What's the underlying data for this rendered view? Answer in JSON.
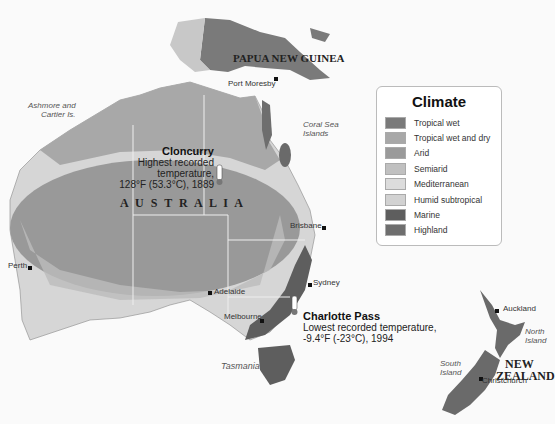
{
  "legend": {
    "title": "Climate",
    "items": [
      {
        "label": "Tropical wet",
        "color": "#7a7a7a"
      },
      {
        "label": "Tropical wet and dry",
        "color": "#a8a8a8"
      },
      {
        "label": "Arid",
        "color": "#9a9a9a"
      },
      {
        "label": "Semiarid",
        "color": "#c0c0c0"
      },
      {
        "label": "Mediterranean",
        "color": "#dcdcdc"
      },
      {
        "label": "Humid subtropical",
        "color": "#d2d2d2"
      },
      {
        "label": "Marine",
        "color": "#5e5e5e"
      },
      {
        "label": "Highland",
        "color": "#6e6e6e"
      }
    ]
  },
  "countries": {
    "png": "PAPUA NEW GUINEA",
    "australia": "A U S T R A L I A",
    "nz_line1": "NEW",
    "nz_line2": "ZEALAND"
  },
  "cities": {
    "port_moresby": "Port Moresby",
    "perth": "Perth",
    "adelaide": "Adelaide",
    "melbourne": "Melbourne",
    "sydney": "Sydney",
    "brisbane": "Brisbane",
    "auckland": "Auckland",
    "christchurch": "Christchurch"
  },
  "places": {
    "ashmore_1": "Ashmore and",
    "ashmore_2": "Cartier Is.",
    "coral_1": "Coral Sea",
    "coral_2": "Islands",
    "tasmania": "Tasmania",
    "north_island_1": "North",
    "north_island_2": "Island",
    "south_island_1": "South",
    "south_island_2": "Island"
  },
  "callouts": {
    "hot": {
      "title": "Cloncurry",
      "line1": "Highest recorded temperature,",
      "line2": "128°F (53.3°C), 1889"
    },
    "cold": {
      "title": "Charlotte Pass",
      "line1": "Lowest recorded temperature,",
      "line2": "-9.4°F (-23°C), 1994"
    }
  }
}
